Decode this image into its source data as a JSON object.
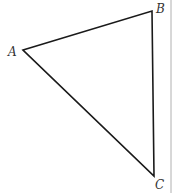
{
  "diagram": {
    "type": "triangle",
    "vertices": [
      {
        "label": "A",
        "x": 23,
        "y": 50,
        "lx": 8,
        "ly": 56
      },
      {
        "label": "B",
        "x": 152,
        "y": 11,
        "lx": 156,
        "ly": 13
      },
      {
        "label": "C",
        "x": 154,
        "y": 176,
        "lx": 155,
        "ly": 189
      }
    ],
    "stroke": "#1a1a1a",
    "border_color": "#aaaaaa"
  }
}
